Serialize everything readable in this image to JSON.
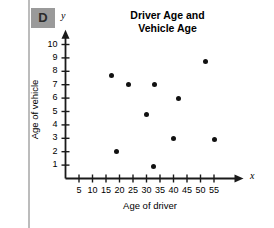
{
  "badge": {
    "label": "D"
  },
  "chart_data": {
    "type": "scatter",
    "title": "Driver Age and Vehicle Age",
    "title_line1": "Driver Age and",
    "title_line2": "Vehicle Age",
    "xlabel": "Age of driver",
    "ylabel": "Age of vehicle",
    "x_axis_letter": "x",
    "y_axis_letter": "y",
    "xlim": [
      0,
      60
    ],
    "ylim": [
      0,
      10.8
    ],
    "xticks": [
      5,
      10,
      15,
      20,
      25,
      30,
      35,
      40,
      45,
      50,
      55
    ],
    "yticks": [
      1,
      2,
      3,
      4,
      5,
      6,
      7,
      8,
      9,
      10
    ],
    "xtick_labels": [
      "5",
      "10",
      "15",
      "20",
      "25",
      "30",
      "35",
      "40",
      "45",
      "50",
      "55"
    ],
    "ytick_labels": [
      "1",
      "2",
      "3",
      "4",
      "5",
      "6",
      "7",
      "8",
      "9",
      "10"
    ],
    "grid": false,
    "legend": null,
    "points": [
      {
        "x": 17,
        "y": 7.7
      },
      {
        "x": 19,
        "y": 2.0
      },
      {
        "x": 23.5,
        "y": 7.0
      },
      {
        "x": 30,
        "y": 4.75
      },
      {
        "x": 32.5,
        "y": 0.9
      },
      {
        "x": 33,
        "y": 7.0
      },
      {
        "x": 40,
        "y": 2.95
      },
      {
        "x": 42,
        "y": 5.95
      },
      {
        "x": 52,
        "y": 8.7
      },
      {
        "x": 55,
        "y": 2.9
      }
    ],
    "marker_color": "#111111",
    "axis_color": "#1a1a1a"
  }
}
